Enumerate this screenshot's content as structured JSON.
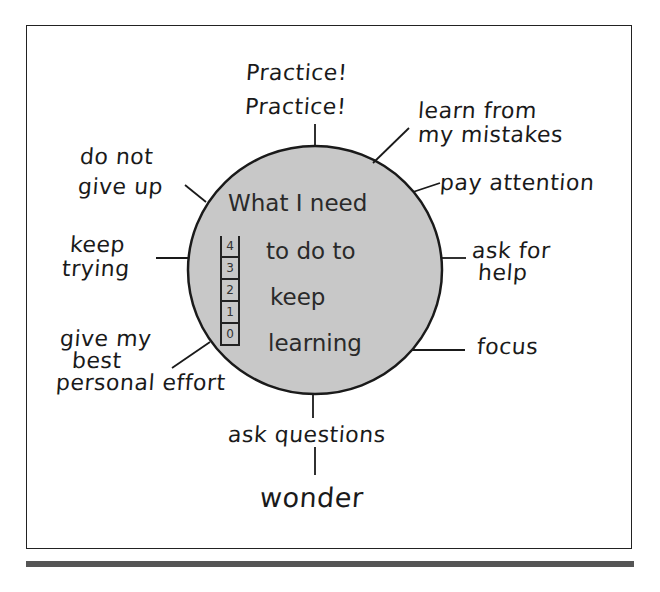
{
  "diagram": {
    "center": {
      "lines": [
        "What I need",
        "to do to",
        "keep",
        "learning"
      ],
      "ladder_steps": [
        "4",
        "3",
        "2",
        "1",
        "0"
      ],
      "fill_color": "#c8c8c8"
    },
    "spokes": [
      {
        "id": "practice",
        "lines": [
          "Practice!",
          "Practice!"
        ]
      },
      {
        "id": "learn-from-mistakes",
        "lines": [
          "learn from",
          "my mistakes"
        ]
      },
      {
        "id": "pay-attention",
        "lines": [
          "pay attention"
        ]
      },
      {
        "id": "ask-for-help",
        "lines": [
          "ask for",
          "help"
        ]
      },
      {
        "id": "focus",
        "lines": [
          "focus"
        ]
      },
      {
        "id": "ask-questions",
        "lines": [
          "ask questions"
        ]
      },
      {
        "id": "wonder",
        "lines": [
          "wonder"
        ]
      },
      {
        "id": "give-best-effort",
        "lines": [
          "give my",
          "best",
          "personal effort"
        ]
      },
      {
        "id": "keep-trying",
        "lines": [
          "keep",
          "trying"
        ]
      },
      {
        "id": "do-not-give-up",
        "lines": [
          "do not",
          "give up"
        ]
      }
    ]
  }
}
